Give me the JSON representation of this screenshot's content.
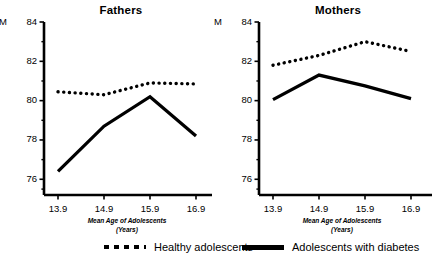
{
  "figure": {
    "y_axis_prefix": "M",
    "legend": [
      {
        "key": "healthy",
        "label": "Healthy adolescents",
        "style": "dotted"
      },
      {
        "key": "diabetes",
        "label": "Adolescents with diabetes",
        "style": "solid"
      }
    ],
    "x_axis_title_line1": "Mean Age of Adolescents",
    "x_axis_title_line2": "(Years)"
  },
  "chart_data": [
    {
      "type": "line",
      "title": "Fathers",
      "xlabel": "Mean Age of Adolescents (Years)",
      "ylabel": "M",
      "x": [
        "13.9",
        "14.9",
        "15.9",
        "16.9"
      ],
      "xtick_labels": [
        "13.9",
        "14.9",
        "15.9",
        "16.9"
      ],
      "ytick_labels": [
        "84",
        "82",
        "80",
        "78",
        "76"
      ],
      "yticks": [
        84,
        82,
        80,
        78,
        76
      ],
      "ylim": [
        75.2,
        84
      ],
      "minor_ticks": true,
      "grid": false,
      "legend_position": "bottom-shared",
      "series": [
        {
          "name": "Healthy adolescents",
          "style": "dotted",
          "values": [
            80.45,
            80.3,
            80.9,
            80.85
          ]
        },
        {
          "name": "Adolescents with diabetes",
          "style": "solid",
          "values": [
            76.4,
            78.7,
            80.2,
            78.2
          ]
        }
      ]
    },
    {
      "type": "line",
      "title": "Mothers",
      "xlabel": "Mean Age of Adolescents (Years)",
      "ylabel": "M",
      "x": [
        "13.9",
        "14.9",
        "15.9",
        "16.9"
      ],
      "xtick_labels": [
        "13.9",
        "14.9",
        "15.9",
        "16.9"
      ],
      "ytick_labels": [
        "84",
        "82",
        "80",
        "78",
        "76"
      ],
      "yticks": [
        84,
        82,
        80,
        78,
        76
      ],
      "ylim": [
        75.2,
        84
      ],
      "minor_ticks": true,
      "grid": false,
      "legend_position": "bottom-shared",
      "series": [
        {
          "name": "Healthy adolescents",
          "style": "dotted",
          "values": [
            81.8,
            82.3,
            83.0,
            82.5
          ]
        },
        {
          "name": "Adolescents with diabetes",
          "style": "solid",
          "values": [
            80.05,
            81.3,
            80.75,
            80.1
          ]
        }
      ]
    }
  ]
}
